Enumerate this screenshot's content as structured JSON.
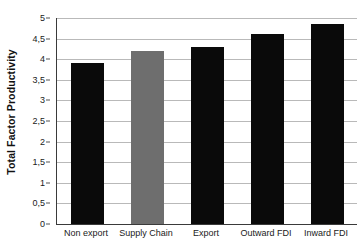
{
  "chart_data": {
    "type": "bar",
    "title": "",
    "xlabel": "",
    "ylabel": "Total Factor Productivity",
    "categories": [
      "Non export",
      "Supply Chain",
      "Export",
      "Outward FDI",
      "Inward FDI"
    ],
    "values": [
      3.9,
      4.2,
      4.3,
      4.6,
      4.85
    ],
    "ylim": [
      0,
      5
    ],
    "ytick_labels": [
      "5",
      "4,5",
      "4",
      "3,5",
      "3",
      "2,5",
      "2",
      "1,5",
      "1",
      "0,5",
      "0"
    ],
    "ytick_values": [
      5,
      4.5,
      4,
      3.5,
      3,
      2.5,
      2,
      1.5,
      1,
      0.5,
      0
    ],
    "grid": true,
    "legend": "none",
    "bar_colors": [
      "#0a0a0a",
      "#6e6e6e",
      "#0a0a0a",
      "#0a0a0a",
      "#0a0a0a"
    ],
    "colors": {
      "bar_black": "#0a0a0a",
      "bar_gray": "#6e6e6e",
      "gridline": "#b9b9b9",
      "axis": "#3a3a3a",
      "background": "#ffffff",
      "text": "#1a1a1a"
    }
  }
}
